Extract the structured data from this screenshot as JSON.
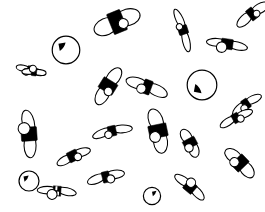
{
  "scene": {
    "title": "Scattered hand-drawn propeller sketches",
    "description": "A white field scattered with small monochrome line-drawn objects, each built from two elongated blade lobes, a solid black central hub and a small open circle, drawn at many different rotations and degrees of foreshortening.",
    "width": 265,
    "height": 212,
    "background_color": "#ffffff",
    "ink_color": "#000000",
    "object_count": 22,
    "style": "pen-and-ink line drawing",
    "objects": [
      {
        "id": "obj-01",
        "name": "propeller-top-left-small",
        "x": 30,
        "y": 70,
        "rotation": 12,
        "scale": 0.62,
        "squash": 0.3,
        "hub": "bar",
        "bead_side": "left",
        "bead_r": 3.4
      },
      {
        "id": "obj-02",
        "name": "circle-top-left",
        "x": 66,
        "y": 50,
        "rotation": 0,
        "scale": 0.8,
        "squash": 0.95,
        "hub": "wedge-ne",
        "bead_side": "none",
        "bead_r": 0
      },
      {
        "id": "obj-03",
        "name": "propeller-top-center",
        "x": 117,
        "y": 22,
        "rotation": -22,
        "scale": 1.1,
        "squash": 0.46,
        "hub": "block",
        "bead_side": "right",
        "bead_r": 5.0
      },
      {
        "id": "obj-04",
        "name": "propeller-top-right-narrow",
        "x": 183,
        "y": 30,
        "rotation": 72,
        "scale": 1.0,
        "squash": 0.22,
        "hub": "bar",
        "bead_side": "left",
        "bead_r": 3.2
      },
      {
        "id": "obj-05",
        "name": "propeller-top-right-edge",
        "x": 227,
        "y": 44,
        "rotation": 8,
        "scale": 0.92,
        "squash": 0.26,
        "hub": "block",
        "bead_side": "left",
        "bead_r": 5.2
      },
      {
        "id": "obj-06",
        "name": "propeller-upper-right-corner",
        "x": 252,
        "y": 14,
        "rotation": -38,
        "scale": 0.85,
        "squash": 0.34,
        "hub": "bar",
        "bead_side": "right",
        "bead_r": 3.4
      },
      {
        "id": "obj-07",
        "name": "propeller-left-edge",
        "x": 34,
        "y": 72,
        "rotation": 6,
        "scale": 0.55,
        "squash": 0.32,
        "hub": "bar",
        "bead_side": "top",
        "bead_r": 3.6
      },
      {
        "id": "obj-08",
        "name": "propeller-mid-left-v",
        "x": 108,
        "y": 86,
        "rotation": -58,
        "scale": 0.95,
        "squash": 0.4,
        "hub": "block",
        "bead_side": "left",
        "bead_r": 4.2
      },
      {
        "id": "obj-09",
        "name": "propeller-mid-center",
        "x": 147,
        "y": 87,
        "rotation": 20,
        "scale": 0.98,
        "squash": 0.34,
        "hub": "bar",
        "bead_side": "left",
        "bead_r": 4.6
      },
      {
        "id": "obj-10",
        "name": "circle-mid-right",
        "x": 202,
        "y": 85,
        "rotation": 0,
        "scale": 0.86,
        "squash": 0.97,
        "hub": "wedge-sw",
        "bead_side": "none",
        "bead_r": 0
      },
      {
        "id": "obj-11",
        "name": "propeller-right-edge-mid",
        "x": 246,
        "y": 104,
        "rotation": -34,
        "scale": 0.78,
        "squash": 0.3,
        "hub": "bar",
        "bead_side": "left",
        "bead_r": 3.6
      },
      {
        "id": "obj-12",
        "name": "propeller-left-vertical",
        "x": 29,
        "y": 134,
        "rotation": 86,
        "scale": 1.08,
        "squash": 0.34,
        "hub": "block",
        "bead_side": "left",
        "bead_r": 6.0
      },
      {
        "id": "obj-13",
        "name": "propeller-lower-left-slant",
        "x": 73,
        "y": 156,
        "rotation": -26,
        "scale": 0.82,
        "squash": 0.3,
        "hub": "block",
        "bead_side": "right",
        "bead_r": 3.8
      },
      {
        "id": "obj-14",
        "name": "propeller-center-low",
        "x": 112,
        "y": 131,
        "rotation": -12,
        "scale": 0.92,
        "squash": 0.26,
        "hub": "bar",
        "bead_side": "left",
        "bead_r": 3.8
      },
      {
        "id": "obj-15",
        "name": "propeller-center-v",
        "x": 158,
        "y": 131,
        "rotation": 78,
        "scale": 1.02,
        "squash": 0.42,
        "hub": "block",
        "bead_side": "right",
        "bead_r": 5.4
      },
      {
        "id": "obj-16",
        "name": "propeller-center-small-v",
        "x": 190,
        "y": 143,
        "rotation": 62,
        "scale": 0.7,
        "squash": 0.44,
        "hub": "block",
        "bead_side": "right",
        "bead_r": 4.2
      },
      {
        "id": "obj-17",
        "name": "propeller-lower-right-v",
        "x": 240,
        "y": 163,
        "rotation": 46,
        "scale": 0.86,
        "squash": 0.42,
        "hub": "block",
        "bead_side": "left",
        "bead_r": 4.6
      },
      {
        "id": "obj-18",
        "name": "propeller-upper-right-tilt",
        "x": 236,
        "y": 118,
        "rotation": -28,
        "scale": 0.8,
        "squash": 0.28,
        "hub": "bar",
        "bead_side": "right",
        "bead_r": 3.6
      },
      {
        "id": "obj-19",
        "name": "circle-bottom-left",
        "x": 29,
        "y": 181,
        "rotation": 0,
        "scale": 0.58,
        "squash": 0.96,
        "hub": "wedge-ne",
        "bead_side": "none",
        "bead_r": 0
      },
      {
        "id": "obj-20",
        "name": "propeller-bottom-checkered",
        "x": 57,
        "y": 191,
        "rotation": 4,
        "scale": 0.88,
        "squash": 0.26,
        "hub": "checker",
        "bead_side": "left",
        "bead_r": 5.0
      },
      {
        "id": "obj-21",
        "name": "propeller-bottom-center",
        "x": 106,
        "y": 177,
        "rotation": -14,
        "scale": 0.86,
        "squash": 0.3,
        "hub": "bar",
        "bead_side": "right",
        "bead_r": 4.0
      },
      {
        "id": "obj-22",
        "name": "propeller-bottom-right",
        "x": 190,
        "y": 187,
        "rotation": 40,
        "scale": 0.84,
        "squash": 0.3,
        "hub": "block",
        "bead_side": "top",
        "bead_r": 4.6
      },
      {
        "id": "obj-23",
        "name": "circle-bottom-center",
        "x": 152,
        "y": 196,
        "rotation": 0,
        "scale": 0.5,
        "squash": 0.94,
        "hub": "wedge-n",
        "bead_side": "none",
        "bead_r": 0
      }
    ]
  }
}
